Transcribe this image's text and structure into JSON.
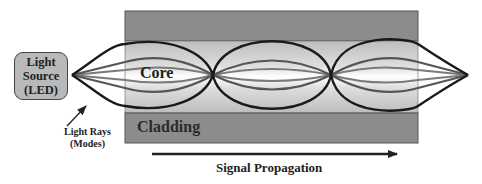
{
  "diagram": {
    "title": "",
    "source": {
      "lines": [
        "Light",
        "Source",
        "(LED)"
      ]
    },
    "regions": {
      "core_label": "Core",
      "cladding_label": "Cladding"
    },
    "annotations": {
      "rays_line1": "Light Rays",
      "rays_line2": "(Modes)",
      "propagation": "Signal Propagation"
    },
    "colors": {
      "cladding": "#8c8c8c",
      "core_outer": "#c4c4c4",
      "core_center": "#ffffff",
      "ray_outer": "#1a1a1a",
      "ray_mid": "#555555",
      "ray_inner": "#7a7a7a",
      "source_fill": "#b9b9b9"
    },
    "nodes_x": [
      72,
      213,
      331,
      468
    ]
  }
}
